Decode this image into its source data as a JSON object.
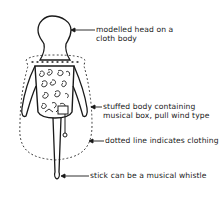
{
  "diagram": {
    "title": "",
    "annotations": [
      {
        "id": "head",
        "lines": [
          "modelled head on a",
          "cloth body"
        ]
      },
      {
        "id": "body",
        "lines": [
          "stuffed body containing",
          "musical box, pull wind type"
        ]
      },
      {
        "id": "clothing",
        "lines": [
          "dotted line indicates clothing"
        ]
      },
      {
        "id": "stick",
        "lines": [
          "stick can be a musical whistle"
        ]
      }
    ]
  }
}
